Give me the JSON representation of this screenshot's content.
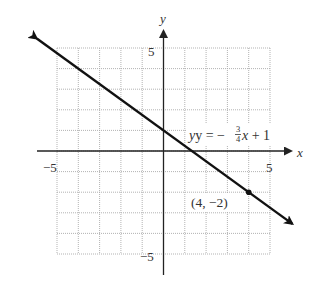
{
  "chart_data": {
    "type": "line",
    "title": "",
    "xlabel": "x",
    "ylabel": "y",
    "xlim": [
      -5,
      5
    ],
    "ylim": [
      -5,
      5
    ],
    "grid": true,
    "x_tick_labels": [
      "-5",
      "5"
    ],
    "y_tick_labels": [
      "5",
      "-5"
    ],
    "series": [
      {
        "name": "y = -3/4x + 1",
        "slope": -0.75,
        "intercept": 1,
        "x_range": [
          -5.95,
          6.05
        ],
        "arrows_both_ends": true
      }
    ],
    "points": [
      {
        "x": 4,
        "y": -2,
        "label": "(4, −2)"
      }
    ],
    "annotations": [
      {
        "text": "y = −3/4x + 1",
        "near": [
          2.3,
          0.6
        ]
      }
    ]
  },
  "labels": {
    "x_axis": "x",
    "y_axis": "y",
    "x_min_tick": "−5",
    "x_max_tick": "5",
    "y_max_tick": "5",
    "y_min_tick": "−5",
    "eq_prefix": "y = −",
    "eq_num": "3",
    "eq_den": "4",
    "eq_suffix": "x + 1",
    "point_label": "(4, −2)"
  },
  "colors": {
    "grid": "#aaaaaa",
    "axis": "#222222",
    "line": "#111111",
    "text": "#333333"
  }
}
